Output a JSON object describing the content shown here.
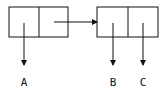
{
  "diagram": {
    "type": "box-and-pointer",
    "pairs": [
      {
        "id": "pair-1",
        "car": "A",
        "cdr": "pair-2"
      },
      {
        "id": "pair-2",
        "car": "B",
        "cdr": "C"
      }
    ],
    "labels": {
      "a": "A",
      "b": "B",
      "c": "C"
    },
    "colors": {
      "stroke": "#111111",
      "background": "#ffffff"
    }
  }
}
